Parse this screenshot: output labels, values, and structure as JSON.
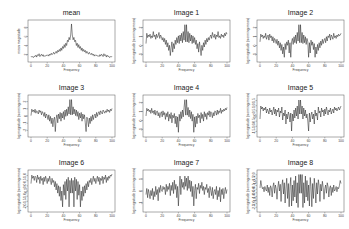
{
  "figure": {
    "width": 349,
    "height": 229,
    "rows": 3,
    "cols": 3
  },
  "chart_data": [
    {
      "type": "line",
      "title": "mean",
      "xlabel": "Frequency",
      "ylabel": "mean magnitude",
      "xlim": [
        0,
        100
      ],
      "xticks": [
        0,
        20,
        40,
        60,
        80,
        100
      ],
      "yticks": [
        "2",
        "4",
        "6",
        "8"
      ],
      "ylim": [
        1,
        8.5
      ],
      "values": [
        1.6,
        1.4,
        1.5,
        1.3,
        1.6,
        1.5,
        1.8,
        1.4,
        1.9,
        1.7,
        2.1,
        1.5,
        1.8,
        2.0,
        1.6,
        1.9,
        1.5,
        1.7,
        1.6,
        1.8,
        1.7,
        1.9,
        1.6,
        2.0,
        1.8,
        2.2,
        1.9,
        2.1,
        2.4,
        2.0,
        2.3,
        2.6,
        2.2,
        2.8,
        2.5,
        3.0,
        2.6,
        3.3,
        2.8,
        3.6,
        3.2,
        4.0,
        3.4,
        4.3,
        3.8,
        4.9,
        4.6,
        5.5,
        5.0,
        6.0,
        8.3,
        6.0,
        5.0,
        5.5,
        4.6,
        4.9,
        3.8,
        4.3,
        3.4,
        4.0,
        3.2,
        3.6,
        2.8,
        3.3,
        2.6,
        3.0,
        2.5,
        2.8,
        2.2,
        2.6,
        2.3,
        2.0,
        2.4,
        2.1,
        1.9,
        2.2,
        1.8,
        2.0,
        1.6,
        1.9,
        1.7,
        1.8,
        1.6,
        1.7,
        1.5,
        1.9,
        1.6,
        2.0,
        1.8,
        1.5,
        2.1,
        1.7,
        1.9,
        1.4,
        1.8,
        1.5,
        1.6,
        1.3,
        1.5,
        1.4,
        1.6
      ]
    },
    {
      "type": "line",
      "title": "Image 1",
      "xlabel": "Frequency",
      "ylabel": "log magnitude (norming mean)",
      "xlim": [
        0,
        100
      ],
      "xticks": [
        0,
        20,
        40,
        60,
        80,
        100
      ],
      "yticks": [
        "-1",
        "0",
        "1",
        "2"
      ],
      "ylim": [
        -1.6,
        2.6
      ],
      "values": [
        0.2,
        1.4,
        0.9,
        1.2,
        1.0,
        1.3,
        0.8,
        1.1,
        0.9,
        1.6,
        1.0,
        1.2,
        0.7,
        1.3,
        0.9,
        1.1,
        1.5,
        0.8,
        1.2,
        1.0,
        0.6,
        0.9,
        0.4,
        0.8,
        0.1,
        0.6,
        -0.2,
        0.3,
        -0.6,
        0.0,
        -1.2,
        -0.3,
        0.4,
        -0.8,
        0.2,
        -0.4,
        0.6,
        0.1,
        0.9,
        0.3,
        1.1,
        0.2,
        1.2,
        0.5,
        1.4,
        0.3,
        1.6,
        0.6,
        2.4,
        0.4,
        2.4,
        0.4,
        1.6,
        0.3,
        1.4,
        0.5,
        1.2,
        0.2,
        1.1,
        0.3,
        0.9,
        0.1,
        0.6,
        -0.4,
        0.2,
        -0.8,
        0.4,
        -0.3,
        -1.2,
        0.0,
        -0.6,
        0.3,
        -0.2,
        0.6,
        0.1,
        0.8,
        0.4,
        0.9,
        0.6,
        1.0,
        1.2,
        0.8,
        1.5,
        1.1,
        0.9,
        1.3,
        0.7,
        1.2,
        1.0,
        1.6,
        0.9,
        1.1,
        0.8,
        1.3,
        1.0,
        1.2,
        0.9,
        1.4,
        1.1,
        1.5,
        1.3
      ]
    },
    {
      "type": "line",
      "title": "Image 2",
      "xlabel": "Frequency",
      "ylabel": "log magnitude (norming mean)",
      "xlim": [
        0,
        100
      ],
      "xticks": [
        0,
        20,
        40,
        60,
        80,
        100
      ],
      "yticks": [
        "-1",
        "0",
        "1",
        "2"
      ],
      "ylim": [
        -1.6,
        2.6
      ],
      "values": [
        0.4,
        1.3,
        1.0,
        1.2,
        0.8,
        1.1,
        0.9,
        1.4,
        0.7,
        1.0,
        1.2,
        0.6,
        1.3,
        0.9,
        1.1,
        0.5,
        1.0,
        0.3,
        0.8,
        0.6,
        0.2,
        0.7,
        0.0,
        0.5,
        -0.3,
        0.3,
        -0.6,
        0.1,
        -1.0,
        -0.2,
        -1.4,
        0.2,
        -0.5,
        0.4,
        0.0,
        0.6,
        -0.9,
        0.3,
        -1.4,
        0.4,
        0.8,
        0.1,
        1.0,
        0.3,
        1.2,
        0.2,
        1.5,
        0.5,
        2.4,
        0.3,
        2.4,
        0.3,
        1.5,
        0.2,
        1.2,
        0.3,
        1.0,
        0.1,
        0.8,
        0.4,
        -1.4,
        0.3,
        -0.9,
        0.6,
        0.0,
        0.4,
        -0.5,
        0.2,
        -1.4,
        -0.2,
        -1.0,
        0.1,
        -0.6,
        0.3,
        -0.3,
        0.5,
        0.0,
        0.7,
        0.2,
        0.6,
        0.8,
        0.3,
        1.0,
        0.5,
        1.1,
        0.9,
        1.3,
        0.6,
        1.2,
        1.0,
        0.7,
        1.4,
        0.9,
        1.1,
        0.8,
        1.2,
        1.0,
        1.3,
        1.1,
        1.2,
        1.4
      ]
    },
    {
      "type": "line",
      "title": "Image 3",
      "xlabel": "Frequency",
      "ylabel": "log magnitude (norming mean)",
      "xlim": [
        0,
        100
      ],
      "xticks": [
        0,
        20,
        40,
        60,
        80,
        100
      ],
      "yticks": [
        "-2",
        "-1",
        "0",
        "1",
        "2"
      ],
      "ylim": [
        -2.2,
        2.3
      ],
      "values": [
        0.1,
        0.9,
        0.6,
        0.8,
        0.5,
        0.9,
        0.4,
        0.7,
        0.6,
        0.3,
        0.8,
        0.5,
        0.7,
        0.2,
        0.6,
        0.4,
        0.0,
        0.5,
        -0.2,
        0.3,
        0.1,
        -0.4,
        0.2,
        -0.6,
        0.0,
        -0.9,
        -0.2,
        -1.3,
        -0.4,
        -0.1,
        -1.9,
        -0.3,
        0.2,
        -0.8,
        0.3,
        -0.3,
        0.5,
        -0.6,
        0.4,
        -0.2,
        0.6,
        -0.4,
        0.8,
        0.0,
        0.9,
        0.1,
        1.2,
        0.3,
        2.1,
        0.2,
        2.1,
        0.2,
        1.2,
        0.3,
        0.9,
        0.1,
        0.8,
        0.0,
        0.6,
        -0.4,
        0.4,
        -0.2,
        0.5,
        -0.6,
        0.3,
        -0.3,
        0.2,
        -0.8,
        -1.9,
        -0.1,
        -0.4,
        -1.3,
        -0.2,
        -0.9,
        0.0,
        -0.6,
        0.2,
        -0.4,
        0.1,
        0.3,
        -0.2,
        0.5,
        0.0,
        0.4,
        0.6,
        0.2,
        0.7,
        0.5,
        0.3,
        0.8,
        0.6,
        0.4,
        0.7,
        0.5,
        0.9,
        0.6,
        0.8,
        0.5,
        0.9,
        0.7,
        1.0
      ]
    },
    {
      "type": "line",
      "title": "Image 4",
      "xlabel": "Frequency",
      "ylabel": "log magnitude (norming mean)",
      "xlim": [
        0,
        100
      ],
      "xticks": [
        0,
        20,
        40,
        60,
        80,
        100
      ],
      "yticks": [
        "-1",
        "0",
        "1",
        "2"
      ],
      "ylim": [
        -1.8,
        2.4
      ],
      "values": [
        0.3,
        1.2,
        0.9,
        1.1,
        0.8,
        1.0,
        0.6,
        1.2,
        0.7,
        0.9,
        0.5,
        1.0,
        0.4,
        0.8,
        0.9,
        0.3,
        0.7,
        0.1,
        0.6,
        0.8,
        0.2,
        0.9,
        0.4,
        0.7,
        -0.1,
        0.6,
        0.2,
        0.8,
        -0.3,
        0.5,
        0.0,
        0.7,
        -0.5,
        0.4,
        0.1,
        0.6,
        -0.6,
        0.3,
        -1.0,
        0.2,
        -1.6,
        0.5,
        -0.3,
        0.8,
        0.0,
        1.0,
        0.2,
        1.3,
        2.2,
        0.4,
        2.2,
        0.4,
        1.3,
        0.2,
        1.0,
        0.0,
        0.8,
        -0.3,
        0.5,
        -1.6,
        0.2,
        -1.0,
        0.3,
        -0.6,
        0.6,
        0.1,
        0.4,
        -0.5,
        0.7,
        0.0,
        0.5,
        -0.3,
        0.8,
        0.2,
        0.6,
        -0.1,
        0.7,
        0.4,
        0.9,
        0.2,
        0.8,
        0.6,
        0.1,
        0.7,
        0.3,
        0.9,
        0.8,
        0.4,
        1.0,
        0.5,
        0.9,
        0.7,
        1.2,
        0.6,
        1.0,
        0.8,
        1.1,
        0.9,
        1.2,
        1.0,
        1.3
      ]
    },
    {
      "type": "line",
      "title": "Image 5",
      "xlabel": "Frequency",
      "ylabel": "log magnitude (norming mean)",
      "xlim": [
        0,
        100
      ],
      "xticks": [
        0,
        20,
        40,
        60,
        80,
        100
      ],
      "yticks": [
        "-1.5",
        "-1.0",
        "-0.5",
        "0.0",
        "0.5",
        "1.0",
        "1.5"
      ],
      "ylim": [
        -1.8,
        1.8
      ],
      "values": [
        -0.3,
        1.0,
        0.7,
        0.9,
        0.5,
        0.8,
        0.6,
        0.9,
        0.3,
        0.7,
        0.5,
        0.2,
        0.8,
        0.4,
        0.6,
        0.1,
        0.5,
        0.9,
        0.2,
        0.7,
        0.0,
        0.6,
        0.4,
        0.8,
        -0.1,
        0.5,
        0.3,
        0.9,
        -0.4,
        0.3,
        0.0,
        0.6,
        -0.8,
        0.2,
        -0.3,
        0.4,
        0.1,
        -0.6,
        0.3,
        -1.5,
        0.2,
        -0.5,
        0.6,
        -0.2,
        0.8,
        0.0,
        1.0,
        -0.3,
        1.6,
        0.2,
        1.6,
        0.2,
        1.0,
        -0.3,
        0.8,
        0.0,
        0.6,
        -0.2,
        0.2,
        -0.5,
        -1.5,
        0.3,
        -0.6,
        0.1,
        0.4,
        -0.3,
        0.2,
        -0.8,
        0.6,
        0.0,
        0.3,
        -0.4,
        0.9,
        0.3,
        0.5,
        -0.1,
        0.8,
        0.4,
        0.6,
        0.0,
        0.7,
        0.2,
        0.9,
        0.5,
        0.1,
        0.6,
        0.4,
        0.8,
        0.2,
        0.5,
        0.7,
        0.3,
        0.9,
        0.6,
        0.8,
        0.5,
        0.7,
        0.9,
        0.6,
        0.8,
        1.0
      ]
    },
    {
      "type": "line",
      "title": "Image 6",
      "xlabel": "Frequency",
      "ylabel": "log magnitude (norming mean)",
      "xlim": [
        0,
        100
      ],
      "xticks": [
        0,
        20,
        40,
        60,
        80,
        100
      ],
      "yticks": [
        "-2.0",
        "-1.5",
        "-1.0",
        "-0.5",
        "0.0",
        "0.5",
        "1.0"
      ],
      "ylim": [
        -2.1,
        1.3
      ],
      "values": [
        0.3,
        1.1,
        0.8,
        1.0,
        0.6,
        1.0,
        0.9,
        0.4,
        1.1,
        0.7,
        0.9,
        0.3,
        1.0,
        0.6,
        0.8,
        0.2,
        0.9,
        0.5,
        1.0,
        0.7,
        0.3,
        0.8,
        0.5,
        1.0,
        0.6,
        0.2,
        0.8,
        0.4,
        0.6,
        0.0,
        0.5,
        -0.3,
        0.3,
        -0.6,
        0.1,
        -0.9,
        0.0,
        -1.3,
        -0.4,
        -1.9,
        0.2,
        -0.8,
        0.5,
        -1.2,
        0.7,
        -0.4,
        0.9,
        -1.9,
        0.6,
        -0.6,
        0.8,
        -0.6,
        0.6,
        -1.9,
        0.9,
        -0.4,
        0.7,
        -1.2,
        0.5,
        -0.8,
        0.2,
        -1.9,
        -0.4,
        -1.3,
        0.0,
        -0.9,
        0.1,
        -0.6,
        0.3,
        -0.3,
        0.5,
        0.0,
        0.6,
        0.4,
        0.8,
        0.2,
        0.6,
        1.0,
        0.5,
        0.8,
        0.3,
        0.7,
        1.0,
        0.5,
        0.9,
        0.2,
        0.8,
        0.6,
        1.0,
        0.3,
        0.9,
        0.7,
        1.1,
        0.4,
        0.9,
        0.6,
        1.0,
        0.8,
        1.1,
        1.0,
        1.2
      ]
    },
    {
      "type": "line",
      "title": "Image 7",
      "xlabel": "Frequency",
      "ylabel": "log magnitude (norming mean)",
      "xlim": [
        0,
        100
      ],
      "xticks": [
        0,
        20,
        40,
        60,
        80,
        100
      ],
      "yticks": [
        "-1",
        "0",
        "1"
      ],
      "ylim": [
        -1.6,
        1.9
      ],
      "values": [
        -0.2,
        0.4,
        -0.5,
        0.3,
        -0.1,
        -0.6,
        0.2,
        -0.3,
        0.4,
        -0.7,
        0.1,
        -0.4,
        0.6,
        -0.2,
        0.3,
        -0.8,
        0.5,
        0.0,
        0.7,
        0.2,
        0.1,
        0.6,
        0.3,
        0.5,
        -0.2,
        0.8,
        0.1,
        0.6,
        0.3,
        0.9,
        -0.3,
        0.7,
        0.2,
        1.0,
        -0.1,
        1.2,
        0.3,
        0.8,
        -0.5,
        0.6,
        -1.3,
        0.4,
        1.6,
        -0.2,
        1.3,
        0.5,
        1.0,
        0.3,
        1.6,
        0.6,
        1.4,
        0.2,
        1.6,
        0.4,
        1.2,
        0.1,
        1.1,
        -0.4,
        0.6,
        -1.3,
        0.2,
        0.8,
        -0.6,
        0.5,
        0.3,
        0.9,
        -0.1,
        0.7,
        0.4,
        1.0,
        0.2,
        0.6,
        -0.2,
        0.5,
        0.3,
        0.8,
        0.0,
        0.4,
        -0.5,
        0.6,
        0.2,
        -0.3,
        0.5,
        -0.6,
        0.1,
        0.3,
        -0.2,
        0.6,
        -0.7,
        0.2,
        -0.4,
        0.5,
        -0.9,
        0.3,
        -0.2,
        0.4,
        -0.6,
        0.1,
        0.5,
        -0.1,
        0.3
      ]
    },
    {
      "type": "line",
      "title": "Image 8",
      "xlabel": "Frequency",
      "ylabel": "log magnitude (norming mean)",
      "xlim": [
        0,
        100
      ],
      "xticks": [
        0,
        20,
        40,
        60,
        80,
        100
      ],
      "yticks": [
        "-2.5",
        "-2.0",
        "-1.5",
        "-1.0",
        "-0.5",
        "0.0",
        "0.5",
        "1.0",
        "1.5",
        "2.0"
      ],
      "ylim": [
        -2.6,
        2.2
      ],
      "values": [
        0.2,
        1.2,
        0.5,
        0.1,
        0.3,
        -0.3,
        0.4,
        0.0,
        -0.2,
        0.6,
        -0.4,
        0.3,
        -0.8,
        0.5,
        0.2,
        -1.0,
        0.4,
        0.9,
        -0.5,
        0.6,
        0.1,
        -1.3,
        0.3,
        1.1,
        -0.2,
        0.7,
        -1.6,
        0.5,
        1.3,
        -0.6,
        0.9,
        -1.8,
        0.2,
        1.5,
        -1.2,
        0.8,
        -2.3,
        0.4,
        1.6,
        -2.2,
        0.6,
        -1.5,
        1.2,
        -1.0,
        1.8,
        -1.8,
        0.9,
        -2.4,
        2.0,
        -0.5,
        2.0,
        -0.5,
        2.0,
        -2.4,
        0.9,
        -1.8,
        1.8,
        -1.0,
        1.2,
        -1.5,
        0.6,
        -2.2,
        1.6,
        0.4,
        -2.3,
        0.8,
        -1.2,
        1.5,
        0.2,
        -1.8,
        0.9,
        -0.6,
        1.3,
        0.5,
        -1.6,
        0.7,
        -0.2,
        1.1,
        0.3,
        -1.3,
        0.1,
        0.6,
        -0.5,
        0.9,
        0.4,
        -1.0,
        0.2,
        0.5,
        -0.8,
        0.3,
        -0.4,
        0.6,
        -0.2,
        0.0,
        0.4,
        -0.3,
        0.3,
        0.1,
        0.5,
        1.2,
        0.8
      ]
    }
  ],
  "style": {
    "line_color": "#1a1a1a",
    "box_color": "#555555",
    "background": "#ffffff"
  }
}
